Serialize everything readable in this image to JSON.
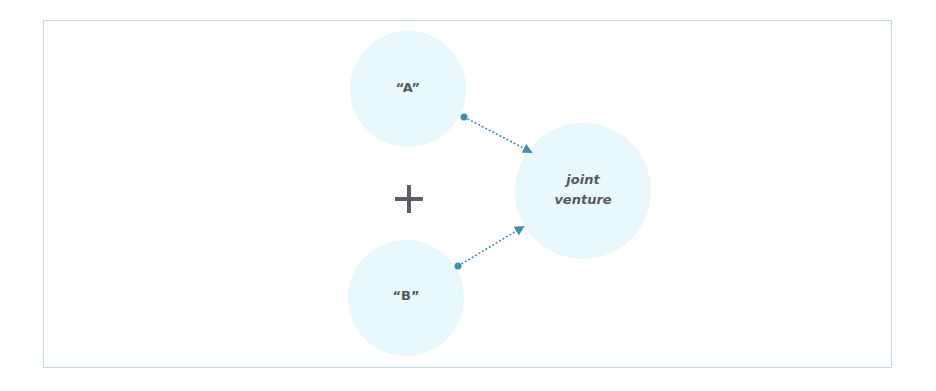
{
  "diagram": {
    "frame_color": "#bcd9e6",
    "circle_fill": "#e9f8fc",
    "arrow_color": "#3f8fb5",
    "text_color": "#555a5e",
    "nodes": [
      {
        "id": "a",
        "label": "“A”"
      },
      {
        "id": "b",
        "label": "“B”"
      },
      {
        "id": "jv",
        "label_line1": "joint",
        "label_line2": "venture"
      }
    ],
    "operator": "+",
    "edges": [
      {
        "from": "a",
        "to": "jv",
        "style": "dotted-arrow"
      },
      {
        "from": "b",
        "to": "jv",
        "style": "dotted-arrow"
      }
    ]
  }
}
